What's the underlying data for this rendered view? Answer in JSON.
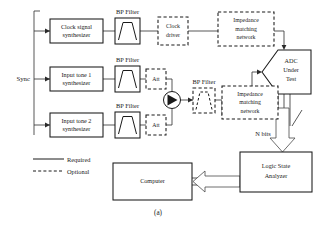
{
  "figure": {
    "caption": "(a)"
  },
  "blocks": {
    "clock_synth": {
      "line1": "Clock signal",
      "line2": "synthesizer"
    },
    "tone1_synth": {
      "line1": "Input tone 1",
      "line2": "synthesizer"
    },
    "tone2_synth": {
      "line1": "Input tone 2",
      "line2": "synthesizer"
    },
    "clock_driver": {
      "line1": "Clock",
      "line2": "driver"
    },
    "imn_top": {
      "line1": "Impedance",
      "line2": "matching",
      "line3": "network"
    },
    "imn_bottom": {
      "line1": "Impedance",
      "line2": "matching",
      "line3": "network"
    },
    "adc": {
      "line1": "ADC",
      "line2": "Under",
      "line3": "Test"
    },
    "logic_analyzer": {
      "line1": "Logic State",
      "line2": "Analyzer"
    },
    "computer": {
      "line1": "Computer"
    },
    "att1": {
      "label": "Att"
    },
    "att2": {
      "label": "Att"
    }
  },
  "labels": {
    "bp_filter_clock": "BP Filter",
    "bp_filter_tone1": "BP Filter",
    "bp_filter_tone2": "BP Filter",
    "bp_filter_combined": "BP Filter",
    "sync": "Sync",
    "n_bits": "N  bits"
  },
  "legend": {
    "required": "Required",
    "optional": "Optional"
  },
  "icons": {
    "bandpass_filter": "bandpass-filter-icon",
    "mixer_combiner": "mixer-combiner-icon",
    "attenuator": "attenuator-icon"
  },
  "colors": {
    "stroke": "#1a1a1a",
    "wire": "#3a3a3a",
    "background": "#ffffff"
  }
}
